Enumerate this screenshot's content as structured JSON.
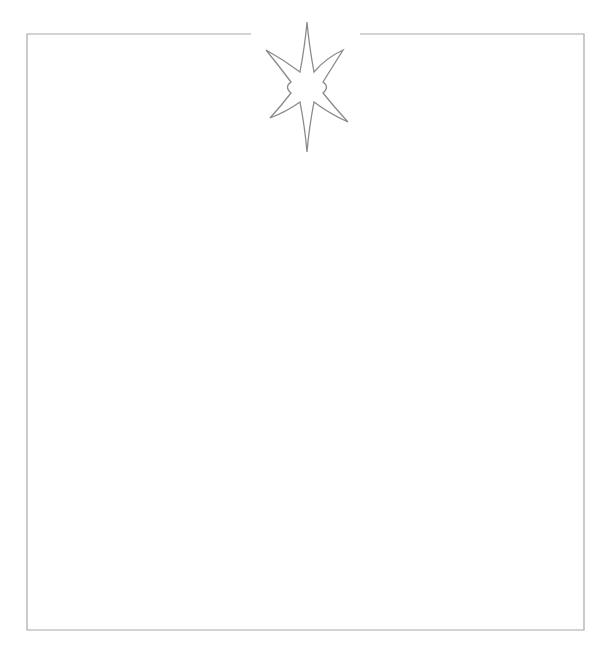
{
  "frame": {
    "description": "Decorative rectangular border with a gap in the top edge holding a six-pointed sparkle star",
    "border_color": "#a8a8a8",
    "star_color": "#8a8a8a",
    "background": "#ffffff",
    "rect": {
      "left": 27,
      "top": 34,
      "right": 584,
      "bottom": 630
    },
    "top_gap": {
      "start_x": 251,
      "end_x": 360
    }
  },
  "ornament": {
    "icon": "sparkle-star-icon",
    "points": 6,
    "center": {
      "x": 307,
      "y": 87
    }
  }
}
